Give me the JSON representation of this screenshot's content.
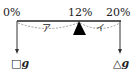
{
  "diagram": {
    "type": "lever-balance concentration diagram",
    "beam": {
      "left_label": "0%",
      "fulcrum_label": "12%",
      "right_label": "20%"
    },
    "segments": {
      "left": "ア",
      "right": "イ"
    },
    "weights": {
      "left": {
        "symbol": "□",
        "unit": "g"
      },
      "right": {
        "symbol": "△",
        "unit": "g"
      }
    },
    "colors": {
      "line": "#222222",
      "dashed": "#888888",
      "fulcrum": "#000000"
    }
  }
}
